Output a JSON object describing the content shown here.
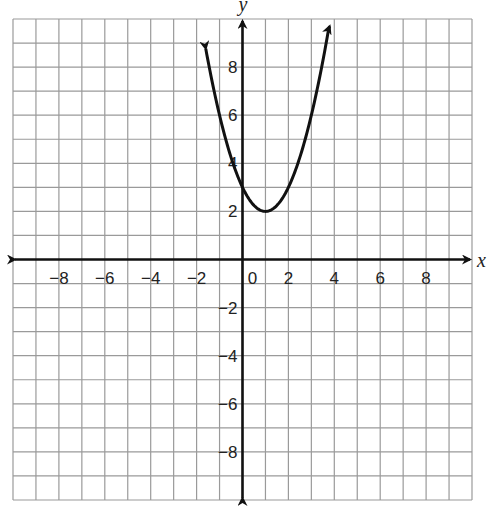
{
  "chart_data": {
    "type": "line",
    "title": "",
    "xlabel": "x",
    "ylabel": "y",
    "xlim": [
      -10,
      10
    ],
    "ylim": [
      -10,
      10
    ],
    "grid": true,
    "grid_step": 1,
    "x_ticks": [
      -8,
      -6,
      -4,
      -2,
      0,
      2,
      4,
      6,
      8
    ],
    "x_tick_labels": [
      "−8",
      "−6",
      "−4",
      "−2",
      "0",
      "2",
      "4",
      "6",
      "8"
    ],
    "y_ticks": [
      -8,
      -6,
      -4,
      -2,
      2,
      4,
      6,
      8
    ],
    "y_tick_labels": [
      "−8",
      "−6",
      "−4",
      "−2",
      "2",
      "4",
      "6",
      "8"
    ],
    "series": [
      {
        "name": "parabola",
        "equation": "y = x^2 - 2x + 3",
        "vertex": [
          1,
          2
        ],
        "y_intercept": 3,
        "x_range": [
          -1.6,
          3.8
        ],
        "points": [
          [
            -1.6,
            9.76
          ],
          [
            -1,
            6
          ],
          [
            0,
            3
          ],
          [
            1,
            2
          ],
          [
            2,
            3
          ],
          [
            3,
            6
          ],
          [
            3.8,
            10.84
          ]
        ],
        "arrows_on_ends": true
      }
    ],
    "axes_arrows": true
  },
  "colors": {
    "grid": "#9a9a9a",
    "axis": "#111111",
    "curve": "#111111",
    "background": "#ffffff"
  }
}
